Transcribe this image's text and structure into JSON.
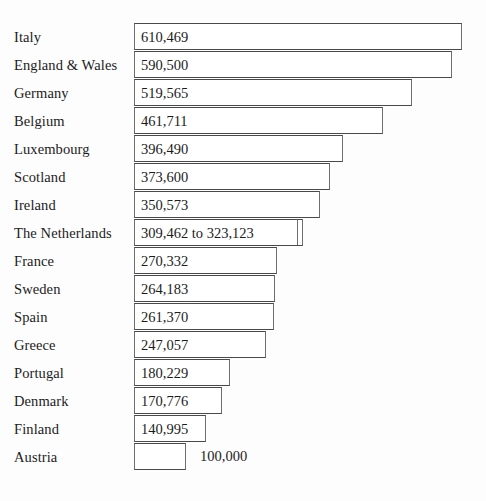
{
  "chart_data": {
    "type": "bar",
    "title": "",
    "subtitle": "",
    "xlabel": "",
    "ylabel": "",
    "orientation": "horizontal",
    "grid": false,
    "legend": false,
    "axis_visible": false,
    "xlim": [
      0,
      700000
    ],
    "categories": [
      "Italy",
      "England & Wales",
      "Germany",
      "Belgium",
      "Luxembourg",
      "Scotland",
      "Ireland",
      "The Netherlands",
      "France",
      "Sweden",
      "Spain",
      "Greece",
      "Portugal",
      "Denmark",
      "Finland",
      "Austria"
    ],
    "values": [
      610469,
      590500,
      519565,
      461711,
      396490,
      373600,
      350573,
      323123,
      270332,
      264183,
      261370,
      247057,
      180229,
      170776,
      140995,
      100000
    ],
    "value_labels": [
      "610,469",
      "590,500",
      "519,565",
      "461,711",
      "396,490",
      "373,600",
      "350,573",
      "309,462 to 323,123",
      "270,332",
      "264,183",
      "261,370",
      "247,057",
      "180,229",
      "170,776",
      "140,995",
      "100,000"
    ],
    "range_row": {
      "category": "The Netherlands",
      "low": 309462,
      "high": 323123
    },
    "colors": {
      "bar_fill": "#ffffff",
      "bar_border": "#6e6e6e",
      "text": "#1c1c1c",
      "background": "#fdfdfd"
    }
  },
  "rows": [
    {
      "label": "Italy",
      "value_label": "610,469",
      "bar_width": 328,
      "label_inside": true,
      "inner_edge": null
    },
    {
      "label": "England & Wales",
      "value_label": "590,500",
      "bar_width": 318,
      "label_inside": true,
      "inner_edge": null
    },
    {
      "label": "Germany",
      "value_label": "519,565",
      "bar_width": 278,
      "label_inside": true,
      "inner_edge": null
    },
    {
      "label": "Belgium",
      "value_label": "461,711",
      "bar_width": 249,
      "label_inside": true,
      "inner_edge": null
    },
    {
      "label": "Luxembourg",
      "value_label": "396,490",
      "bar_width": 209,
      "label_inside": true,
      "inner_edge": null
    },
    {
      "label": "Scotland",
      "value_label": "373,600",
      "bar_width": 196,
      "label_inside": true,
      "inner_edge": null
    },
    {
      "label": "Ireland",
      "value_label": "350,573",
      "bar_width": 186,
      "label_inside": true,
      "inner_edge": null
    },
    {
      "label": "The Netherlands",
      "value_label": "309,462 to 323,123",
      "bar_width": 169,
      "label_inside": true,
      "inner_edge": 162
    },
    {
      "label": "France",
      "value_label": "270,332",
      "bar_width": 143,
      "label_inside": true,
      "inner_edge": null
    },
    {
      "label": "Sweden",
      "value_label": "264,183",
      "bar_width": 141,
      "label_inside": true,
      "inner_edge": null
    },
    {
      "label": "Spain",
      "value_label": "261,370",
      "bar_width": 140,
      "label_inside": true,
      "inner_edge": null
    },
    {
      "label": "Greece",
      "value_label": "247,057",
      "bar_width": 132,
      "label_inside": true,
      "inner_edge": null
    },
    {
      "label": "Portugal",
      "value_label": "180,229",
      "bar_width": 96,
      "label_inside": true,
      "inner_edge": null
    },
    {
      "label": "Denmark",
      "value_label": "170,776",
      "bar_width": 88,
      "label_inside": true,
      "inner_edge": null
    },
    {
      "label": "Finland",
      "value_label": "140,995",
      "bar_width": 72,
      "label_inside": true,
      "inner_edge": null
    },
    {
      "label": "Austria",
      "value_label": "100,000",
      "bar_width": 52,
      "label_inside": false,
      "inner_edge": null
    }
  ],
  "layout": {
    "bar_left": 134,
    "row_top_start": 23,
    "row_height": 28,
    "outside_label_gap": 14
  }
}
